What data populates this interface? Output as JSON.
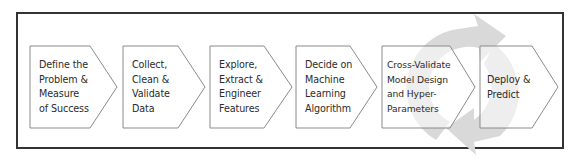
{
  "diagram": {
    "type": "process-flow",
    "direction": "left-to-right",
    "background_cycle": {
      "icon": "cycle-arrows-icon",
      "color": "#d9d9d9"
    },
    "steps": [
      {
        "label": "Define the\nProblem &\nMeasure\nof Success"
      },
      {
        "label": "Collect,\nClean &\nValidate\nData"
      },
      {
        "label": "Explore,\nExtract &\nEngineer\nFeatures"
      },
      {
        "label": "Decide on\nMachine\nLearning\nAlgorithm"
      },
      {
        "label": "Cross-Validate\nModel Design\nand Hyper-\nParameters"
      },
      {
        "label": "Deploy &\nPredict"
      }
    ],
    "colors": {
      "frame_border": "#333333",
      "step_border": "#8a8a8a",
      "step_fill": "#ffffff",
      "text": "#2b2b2b",
      "cycle": "#d9d9d9"
    }
  }
}
